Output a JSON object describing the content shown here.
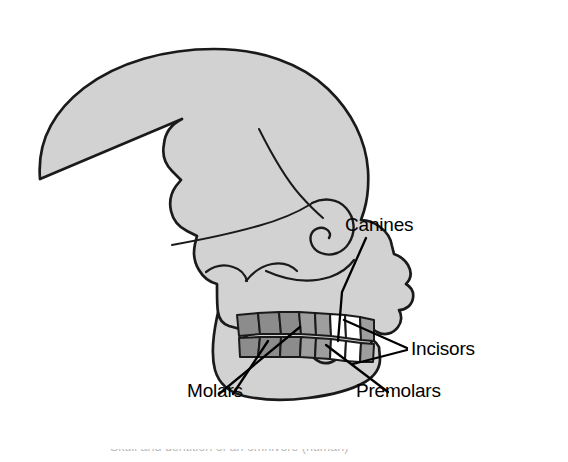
{
  "figure": {
    "title": "Omnivore",
    "panel_letter": "(c)",
    "caption_partial": "Skull and dentition of an omnivore (human)",
    "colors": {
      "background": "#ffffff",
      "skull_fill": "#d2d2d2",
      "outline": "#1a1a1a",
      "molar_fill": "#8c8c8c",
      "premolar_fill": "#9e9e9e",
      "incisor_fill": "#ffffff",
      "canine_fill": "#9e9e9e",
      "text": "#000000"
    }
  },
  "annotations": [
    {
      "id": "canines",
      "label": "Canines",
      "tooth_type": "canine"
    },
    {
      "id": "incisors",
      "label": "Incisors",
      "tooth_type": "incisor"
    },
    {
      "id": "molars",
      "label": "Molars",
      "tooth_type": "molar"
    },
    {
      "id": "premolars",
      "label": "Premolars",
      "tooth_type": "premolar"
    }
  ],
  "diagram": {
    "teeth_groups": {
      "molars": {
        "upper_count": 3,
        "lower_count": 3,
        "shade": "dark-gray"
      },
      "premolars": {
        "upper_count": 2,
        "lower_count": 2,
        "shade": "medium-gray"
      },
      "incisors": {
        "upper_count": 2,
        "lower_count": 2,
        "shade": "white"
      },
      "canines": {
        "upper_count": 1,
        "lower_count": 1,
        "shade": "medium-gray"
      }
    }
  }
}
